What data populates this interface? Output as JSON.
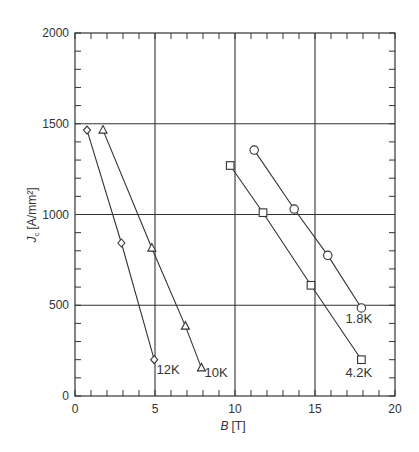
{
  "chart_data": {
    "type": "line",
    "title": "",
    "xlabel": "B [T]",
    "xlabel_italic": "B",
    "xlabel_unit": "[T]",
    "ylabel": "Jc [A/mm²]",
    "ylabel_italic": "J",
    "ylabel_sub": "c",
    "ylabel_unit": "[A/mm²]",
    "xlim": [
      0,
      20
    ],
    "ylim": [
      0,
      2000
    ],
    "xticks": [
      0,
      5,
      10,
      15,
      20
    ],
    "yticks": [
      0,
      500,
      1000,
      1500,
      2000
    ],
    "x_minor_step": 1,
    "y_minor_step": 100,
    "grid": true,
    "legend": "inline labels at line ends",
    "series": [
      {
        "name": "12K",
        "marker": "diamond",
        "x": [
          0.75,
          2.9,
          4.95
        ],
        "y": [
          1465,
          843,
          200
        ],
        "label_pos": [
          5.1,
          120
        ]
      },
      {
        "name": "10K",
        "marker": "triangle",
        "x": [
          1.75,
          4.8,
          6.9,
          7.9
        ],
        "y": [
          1465,
          815,
          385,
          155
        ],
        "label_pos": [
          8.1,
          105
        ]
      },
      {
        "name": "4.2K",
        "marker": "square",
        "x": [
          9.7,
          11.75,
          14.75,
          17.9
        ],
        "y": [
          1270,
          1010,
          610,
          200
        ],
        "label_pos": [
          16.9,
          105
        ]
      },
      {
        "name": "1.8K",
        "marker": "circle",
        "x": [
          11.2,
          13.7,
          15.8,
          17.9
        ],
        "y": [
          1355,
          1030,
          775,
          485
        ],
        "label_pos": [
          16.9,
          400
        ]
      }
    ]
  },
  "colors": {
    "line": "#333333",
    "grid": "#333333",
    "text": "#333333",
    "background": "#ffffff"
  }
}
